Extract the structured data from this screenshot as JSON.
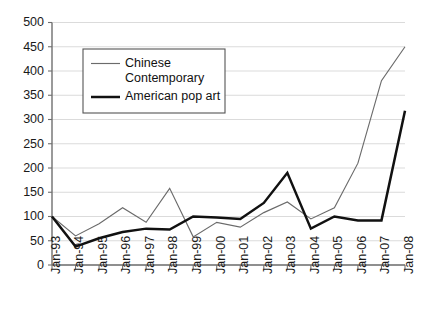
{
  "chart_data": {
    "type": "line",
    "title": "",
    "subtitle": "",
    "xlabel": "",
    "ylabel": "",
    "ylim": [
      0,
      500
    ],
    "ytick_step": 50,
    "grid": true,
    "legend_position": "top-left-inside",
    "categories": [
      "Jan-93",
      "Jan-94",
      "Jan-95",
      "Jan-96",
      "Jan-97",
      "Jan-98",
      "Jan-99",
      "Jan-00",
      "Jan-01",
      "Jan-02",
      "Jan-03",
      "Jan-04",
      "Jan-05",
      "Jan-06",
      "Jan-07",
      "Jan-08"
    ],
    "ytick_labels": [
      "0",
      "50",
      "100",
      "150",
      "200",
      "250",
      "300",
      "350",
      "400",
      "450",
      "500"
    ],
    "ytick_values": [
      0,
      50,
      100,
      150,
      200,
      250,
      300,
      350,
      400,
      450,
      500
    ],
    "series": [
      {
        "name": "Chinese Contemporary",
        "style": "thin",
        "color": "#6b6b6b",
        "values": [
          100,
          60,
          85,
          118,
          88,
          158,
          58,
          88,
          78,
          108,
          130,
          95,
          118,
          210,
          380,
          450
        ]
      },
      {
        "name": "American pop art",
        "style": "thick",
        "color": "#111111",
        "values": [
          100,
          38,
          55,
          68,
          75,
          73,
          100,
          98,
          95,
          128,
          190,
          75,
          100,
          92,
          92,
          318
        ]
      }
    ]
  },
  "legend": {
    "entries": [
      {
        "label_line1": "Chinese",
        "label_line2": "Contemporary",
        "series": "Chinese Contemporary"
      },
      {
        "label_line1": "American pop art",
        "label_line2": "",
        "series": "American pop art"
      }
    ]
  },
  "colors": {
    "chinese_contemporary": "#6b6b6b",
    "american_pop_art": "#111111",
    "gridline": "#d2d2d2",
    "axis": "#6f6f6f",
    "background": "#ffffff"
  }
}
